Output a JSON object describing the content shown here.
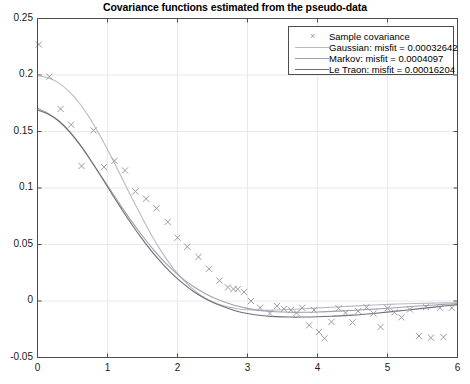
{
  "chart_data": {
    "type": "scatter",
    "title": "Covariance functions estimated from the pseudo-data",
    "xlabel": "",
    "ylabel": "",
    "xlim": [
      0,
      6
    ],
    "ylim": [
      -0.05,
      0.25
    ],
    "xticks": [
      "0",
      "1",
      "2",
      "3",
      "4",
      "5",
      "6"
    ],
    "xtick_values": [
      0,
      1,
      2,
      3,
      4,
      5,
      6
    ],
    "yticks": [
      "-0.05",
      "0",
      "0.05",
      "0.1",
      "0.15",
      "0.2",
      "0.25"
    ],
    "ytick_values": [
      -0.05,
      0,
      0.05,
      0.1,
      0.15,
      0.2,
      0.25
    ],
    "grid": true,
    "legend_position": "top-right",
    "series": [
      {
        "name": "Sample covariance",
        "label": "Sample covariance",
        "type": "scatter",
        "marker": "x",
        "color": "#9a9aa6",
        "points": [
          [
            0.02,
            0.227
          ],
          [
            0.17,
            0.1985
          ],
          [
            0.33,
            0.17
          ],
          [
            0.48,
            0.156
          ],
          [
            0.63,
            0.1195
          ],
          [
            0.8,
            0.151
          ],
          [
            0.95,
            0.1185
          ],
          [
            1.1,
            0.124
          ],
          [
            1.25,
            0.1155
          ],
          [
            1.4,
            0.097
          ],
          [
            1.55,
            0.0905
          ],
          [
            1.7,
            0.082
          ],
          [
            1.86,
            0.07
          ],
          [
            2.0,
            0.056
          ],
          [
            2.14,
            0.048
          ],
          [
            2.3,
            0.039
          ],
          [
            2.45,
            0.0285
          ],
          [
            2.6,
            0.018
          ],
          [
            2.72,
            0.012
          ],
          [
            2.8,
            0.0105
          ],
          [
            2.86,
            0.0105
          ],
          [
            2.95,
            0.008
          ],
          [
            3.05,
            0.0
          ],
          [
            3.18,
            -0.006
          ],
          [
            3.32,
            -0.011
          ],
          [
            3.42,
            -0.0045
          ],
          [
            3.52,
            -0.007
          ],
          [
            3.62,
            -0.008
          ],
          [
            3.7,
            -0.0105
          ],
          [
            3.78,
            -0.006
          ],
          [
            3.88,
            -0.0215
          ],
          [
            3.95,
            -0.008
          ],
          [
            4.02,
            -0.0275
          ],
          [
            4.1,
            -0.033
          ],
          [
            4.2,
            -0.0185
          ],
          [
            4.3,
            -0.0065
          ],
          [
            4.4,
            -0.0105
          ],
          [
            4.5,
            -0.019
          ],
          [
            4.58,
            -0.009
          ],
          [
            4.7,
            -0.0055
          ],
          [
            4.8,
            -0.011
          ],
          [
            4.9,
            -0.023
          ],
          [
            5.0,
            -0.0065
          ],
          [
            5.1,
            -0.01
          ],
          [
            5.2,
            -0.0145
          ],
          [
            5.32,
            -0.0075
          ],
          [
            5.45,
            -0.031
          ],
          [
            5.55,
            -0.0055
          ],
          [
            5.62,
            -0.0325
          ],
          [
            5.75,
            -0.006
          ],
          [
            5.8,
            -0.032
          ],
          [
            5.92,
            -0.006
          ]
        ]
      },
      {
        "name": "Gaussian",
        "label": "Gaussian:  misfit = 0.00032642",
        "type": "line",
        "color": "#b9b9c4",
        "misfit": "0.00032642",
        "curve": [
          [
            0.0,
            0.1995
          ],
          [
            0.15,
            0.1975
          ],
          [
            0.3,
            0.193
          ],
          [
            0.45,
            0.1855
          ],
          [
            0.6,
            0.175
          ],
          [
            0.75,
            0.1615
          ],
          [
            0.9,
            0.1455
          ],
          [
            1.05,
            0.128
          ],
          [
            1.2,
            0.1095
          ],
          [
            1.35,
            0.091
          ],
          [
            1.5,
            0.073
          ],
          [
            1.65,
            0.056
          ],
          [
            1.8,
            0.041
          ],
          [
            1.95,
            0.028
          ],
          [
            2.1,
            0.0175
          ],
          [
            2.25,
            0.009
          ],
          [
            2.4,
            0.0025
          ],
          [
            2.55,
            -0.002
          ],
          [
            2.7,
            -0.005
          ],
          [
            2.85,
            -0.0068
          ],
          [
            3.0,
            -0.0078
          ],
          [
            3.2,
            -0.0082
          ],
          [
            3.4,
            -0.008
          ],
          [
            3.6,
            -0.0075
          ],
          [
            3.9,
            -0.0065
          ],
          [
            4.2,
            -0.0055
          ],
          [
            4.5,
            -0.0045
          ],
          [
            4.8,
            -0.0035
          ],
          [
            5.1,
            -0.0028
          ],
          [
            5.4,
            -0.0022
          ],
          [
            5.7,
            -0.0018
          ],
          [
            6.0,
            -0.0015
          ]
        ]
      },
      {
        "name": "Markov",
        "label": "Markov:   misfit = 0.0004097",
        "type": "line",
        "color": "#a0a0ab",
        "misfit": "0.0004097",
        "curve": [
          [
            0.0,
            0.1705
          ],
          [
            0.15,
            0.166
          ],
          [
            0.3,
            0.1595
          ],
          [
            0.45,
            0.15
          ],
          [
            0.6,
            0.1385
          ],
          [
            0.75,
            0.1255
          ],
          [
            0.9,
            0.1115
          ],
          [
            1.05,
            0.0975
          ],
          [
            1.2,
            0.0835
          ],
          [
            1.35,
            0.07
          ],
          [
            1.5,
            0.0575
          ],
          [
            1.65,
            0.046
          ],
          [
            1.8,
            0.0355
          ],
          [
            1.95,
            0.0265
          ],
          [
            2.1,
            0.0185
          ],
          [
            2.25,
            0.012
          ],
          [
            2.4,
            0.0065
          ],
          [
            2.55,
            0.002
          ],
          [
            2.7,
            -0.0015
          ],
          [
            2.85,
            -0.0045
          ],
          [
            3.0,
            -0.0065
          ],
          [
            3.2,
            -0.0085
          ],
          [
            3.4,
            -0.0095
          ],
          [
            3.6,
            -0.01
          ],
          [
            3.8,
            -0.01
          ],
          [
            4.0,
            -0.0098
          ],
          [
            4.3,
            -0.009
          ],
          [
            4.6,
            -0.008
          ],
          [
            4.9,
            -0.0068
          ],
          [
            5.2,
            -0.0055
          ],
          [
            5.5,
            -0.0042
          ],
          [
            5.75,
            -0.0032
          ],
          [
            6.0,
            -0.0022
          ]
        ]
      },
      {
        "name": "Le Traon",
        "label": "Le Traon: misfit = 0.00016204",
        "type": "line",
        "color": "#6e6e78",
        "misfit": "0.00016204",
        "curve": [
          [
            0.0,
            0.169
          ],
          [
            0.15,
            0.1655
          ],
          [
            0.3,
            0.1595
          ],
          [
            0.45,
            0.1505
          ],
          [
            0.6,
            0.139
          ],
          [
            0.75,
            0.1255
          ],
          [
            0.9,
            0.111
          ],
          [
            1.05,
            0.096
          ],
          [
            1.2,
            0.0815
          ],
          [
            1.35,
            0.0675
          ],
          [
            1.5,
            0.0545
          ],
          [
            1.65,
            0.0425
          ],
          [
            1.8,
            0.032
          ],
          [
            1.95,
            0.0225
          ],
          [
            2.1,
            0.0145
          ],
          [
            2.25,
            0.0075
          ],
          [
            2.4,
            0.002
          ],
          [
            2.55,
            -0.0025
          ],
          [
            2.7,
            -0.006
          ],
          [
            2.85,
            -0.009
          ],
          [
            3.0,
            -0.011
          ],
          [
            3.2,
            -0.0128
          ],
          [
            3.4,
            -0.0138
          ],
          [
            3.6,
            -0.0142
          ],
          [
            3.8,
            -0.0142
          ],
          [
            4.0,
            -0.014
          ],
          [
            4.2,
            -0.0135
          ],
          [
            4.5,
            -0.0125
          ],
          [
            4.8,
            -0.011
          ],
          [
            5.1,
            -0.0092
          ],
          [
            5.4,
            -0.0072
          ],
          [
            5.7,
            -0.0052
          ],
          [
            6.0,
            -0.0032
          ]
        ]
      }
    ]
  },
  "legend": {
    "marker_glyph": "×",
    "entries": [
      {
        "label": "Sample covariance",
        "kind": "marker",
        "color": "#9a9aa6"
      },
      {
        "label": "Gaussian:  misfit = 0.00032642",
        "kind": "line",
        "color": "#b9b9c4"
      },
      {
        "label": "Markov:   misfit = 0.0004097",
        "kind": "line",
        "color": "#a0a0ab"
      },
      {
        "label": "Le Traon: misfit = 0.00016204",
        "kind": "line",
        "color": "#6e6e78"
      }
    ]
  },
  "axes": {
    "box_color": "#4d4d4d",
    "grid_color": "#e8e8ee",
    "tick_color": "#4d4d4d"
  }
}
